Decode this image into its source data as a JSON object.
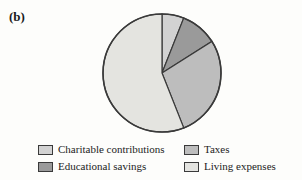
{
  "figure": {
    "panel_label": "(b)",
    "background_color": "#fdfdfb"
  },
  "chart_data": {
    "type": "pie",
    "title": "",
    "subtitle": "",
    "xlabel": "",
    "ylabel": "",
    "grid": false,
    "legend_position": "bottom",
    "legend_columns": 2,
    "start_angle_deg": 0,
    "direction": "clockwise",
    "center": {
      "x": 60,
      "y": 60
    },
    "radius": 59,
    "outline_color": "#3a3a3a",
    "categories": [
      "Charitable contributions",
      "Educational savings",
      "Taxes",
      "Living expenses"
    ],
    "values": [
      6,
      10,
      28,
      56
    ],
    "angles_deg": [
      21.6,
      36.0,
      100.8,
      201.6
    ],
    "colors": [
      "#d2d2d2",
      "#9a9a9a",
      "#bdbdbd",
      "#e4e4e0"
    ],
    "slices": [
      {
        "label": "Charitable contributions",
        "value": 6,
        "start_deg": 0,
        "end_deg": 21.6,
        "color": "#d2d2d2"
      },
      {
        "label": "Educational savings",
        "value": 10,
        "start_deg": 21.6,
        "end_deg": 57.6,
        "color": "#9a9a9a"
      },
      {
        "label": "Taxes",
        "value": 28,
        "start_deg": 57.6,
        "end_deg": 158.4,
        "color": "#bdbdbd"
      },
      {
        "label": "Living expenses",
        "value": 56,
        "start_deg": 158.4,
        "end_deg": 360,
        "color": "#e4e4e0"
      }
    ]
  },
  "legend": {
    "entries": [
      {
        "label": "Charitable contributions",
        "color": "#d2d2d2"
      },
      {
        "label": "Taxes",
        "color": "#bdbdbd"
      },
      {
        "label": "Educational savings",
        "color": "#9a9a9a"
      },
      {
        "label": "Living expenses",
        "color": "#e4e4e0"
      }
    ]
  }
}
